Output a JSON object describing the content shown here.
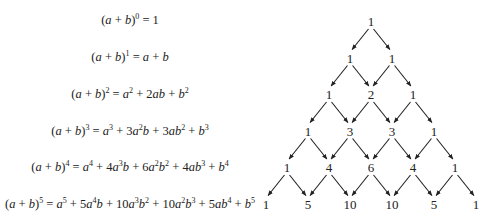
{
  "equations": [
    {
      "power": 0,
      "lhs": "(a + b)^0",
      "rhs": "1",
      "html": "(<i>a</i> + <i>b</i>)<sup>0</sup> = 1"
    },
    {
      "power": 1,
      "lhs": "(a + b)^1",
      "rhs": "a + b",
      "html": "(<i>a</i> + <i>b</i>)<sup>1</sup> = <i>a</i> + <i>b</i>"
    },
    {
      "power": 2,
      "lhs": "(a + b)^2",
      "rhs": "a^2 + 2ab + b^2",
      "html": "(<i>a</i> + <i>b</i>)<sup>2</sup> = <i>a</i><sup>2</sup> + 2<i>ab</i> + <i>b</i><sup>2</sup>"
    },
    {
      "power": 3,
      "lhs": "(a + b)^3",
      "rhs": "a^3 + 3a^2b + 3ab^2 + b^3",
      "html": "(<i>a</i> + <i>b</i>)<sup>3</sup> = <i>a</i><sup>3</sup> + 3<i>a</i><sup>2</sup><i>b</i> + 3<i>ab</i><sup>2</sup> + <i>b</i><sup>3</sup>"
    },
    {
      "power": 4,
      "lhs": "(a + b)^4",
      "rhs": "a^4 + 4a^3b + 6a^2b^2 + 4ab^3 + b^4",
      "html": "(<i>a</i> + <i>b</i>)<sup>4</sup> = <i>a</i><sup>4</sup> + 4<i>a</i><sup>3</sup><i>b</i> + 6<i>a</i><sup>2</sup><i>b</i><sup>2</sup> + 4<i>ab</i><sup>3</sup> + <i>b</i><sup>4</sup>"
    },
    {
      "power": 5,
      "lhs": "(a + b)^5",
      "rhs": "a^5 + 5a^4b + 10a^3b^2 + 10a^2b^3 + 5ab^4 + b^5",
      "html": "(<i>a</i> + <i>b</i>)<sup>5</sup> = <i>a</i><sup>5</sup> + 5<i>a</i><sup>4</sup><i>b</i> + 10<i>a</i><sup>3</sup><i>b</i><sup>2</sup> + 10<i>a</i><sup>2</sup><i>b</i><sup>3</sup> + 5<i>ab</i><sup>4</sup> + <i>b</i><sup>5</sup>"
    }
  ],
  "pascal_triangle": {
    "rows": [
      [
        1
      ],
      [
        1,
        1
      ],
      [
        1,
        2,
        1
      ],
      [
        1,
        3,
        3,
        1
      ],
      [
        1,
        4,
        6,
        4,
        1
      ],
      [
        1,
        5,
        10,
        10,
        5,
        1
      ]
    ],
    "line_color": "#222222",
    "text_color": "#222222"
  }
}
